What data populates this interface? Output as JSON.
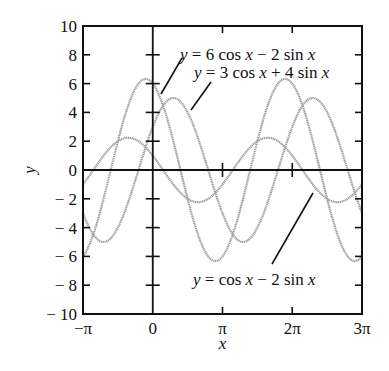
{
  "chart_data": {
    "type": "line",
    "title": "",
    "xlabel": "x",
    "ylabel": "y",
    "xlim": [
      -3.14159,
      9.42478
    ],
    "ylim": [
      -10,
      10
    ],
    "grid": false,
    "legend": "none (curves labeled directly with leader lines)",
    "x_ticks": [
      {
        "value": -3.14159,
        "label": "−π"
      },
      {
        "value": 0,
        "label": "0"
      },
      {
        "value": 3.14159,
        "label": "π"
      },
      {
        "value": 6.28319,
        "label": "2π"
      },
      {
        "value": 9.42478,
        "label": "3π"
      }
    ],
    "y_ticks": [
      {
        "value": 10,
        "label": "10"
      },
      {
        "value": 8,
        "label": "8"
      },
      {
        "value": 6,
        "label": "6"
      },
      {
        "value": 4,
        "label": "4"
      },
      {
        "value": 2,
        "label": "2"
      },
      {
        "value": 0,
        "label": "0"
      },
      {
        "value": -2,
        "label": "− 2"
      },
      {
        "value": -4,
        "label": "− 4"
      },
      {
        "value": -6,
        "label": "− 6"
      },
      {
        "value": -8,
        "label": "− 8"
      },
      {
        "value": -10,
        "label": "− 10"
      }
    ],
    "series": [
      {
        "name": "y = 6 cos x − 2 sin x",
        "a": 6,
        "b": -2,
        "amplitude": 6.32,
        "label": {
          "parts": [
            [
              "y",
              true
            ],
            [
              " = 6 cos ",
              false
            ],
            [
              "x",
              true
            ],
            [
              " − 2 sin ",
              false
            ],
            [
              "x",
              true
            ]
          ]
        },
        "leader": [
          [
            182,
            58
          ],
          [
            161,
            94
          ]
        ],
        "label_pos": [
          180,
          60
        ]
      },
      {
        "name": "y = 3 cos x + 4 sin x",
        "a": 3,
        "b": 4,
        "amplitude": 5,
        "label": {
          "parts": [
            [
              "y",
              true
            ],
            [
              " = 3 cos ",
              false
            ],
            [
              "x",
              true
            ],
            [
              " + 4 sin ",
              false
            ],
            [
              "x",
              true
            ]
          ]
        },
        "leader": [
          [
            211,
            82
          ],
          [
            191,
            110
          ]
        ],
        "label_pos": [
          194,
          78
        ]
      },
      {
        "name": "y = cos x − 2 sin x",
        "a": 1,
        "b": -2,
        "amplitude": 2.24,
        "label": {
          "parts": [
            [
              "y",
              true
            ],
            [
              " = cos ",
              false
            ],
            [
              "x",
              true
            ],
            [
              " − 2 sin ",
              false
            ],
            [
              "x",
              true
            ]
          ]
        },
        "leader": [
          [
            313,
            193
          ],
          [
            272,
            264
          ]
        ],
        "label_pos": [
          193,
          285
        ]
      }
    ],
    "sample_points": {
      "x": [
        "−π",
        "−π/2",
        "0",
        "π/2",
        "π",
        "3π/2",
        "2π",
        "5π/2",
        "3π"
      ],
      "y = 6 cos x − 2 sin x": [
        -6,
        2,
        6,
        -2,
        -6,
        2,
        6,
        -2,
        -6
      ],
      "y = 3 cos x + 4 sin x": [
        -3,
        -4,
        3,
        4,
        -3,
        -4,
        3,
        4,
        -3
      ],
      "y = cos x − 2 sin x": [
        -1,
        2,
        1,
        -2,
        -1,
        2,
        1,
        -2,
        -1
      ]
    }
  },
  "axes": {
    "x_title": "x",
    "y_title": "y"
  }
}
